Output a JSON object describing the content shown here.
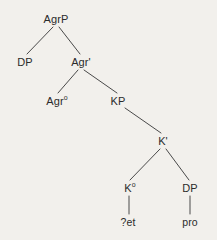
{
  "figure": {
    "kind": "syntax-tree",
    "background_color": "#f2f0ec",
    "line_color": "#4a4a4a",
    "text_color": "#2b2b2b",
    "width": 217,
    "height": 240
  },
  "nodes": {
    "agrp": {
      "label": "AgrP",
      "x": 56,
      "y": 19
    },
    "dp_spec": {
      "label": "DP",
      "x": 25,
      "y": 62
    },
    "agr_bar": {
      "label": "Agr'",
      "x": 81,
      "y": 62
    },
    "agr_head": {
      "label": "Agr",
      "sup": "o",
      "x": 57,
      "y": 101
    },
    "kp": {
      "label": "KP",
      "x": 118,
      "y": 101
    },
    "k_bar": {
      "label": "K'",
      "x": 163,
      "y": 141
    },
    "k_head": {
      "label": "K",
      "sup": "o",
      "x": 130,
      "y": 188
    },
    "dp_comp": {
      "label": "DP",
      "x": 190,
      "y": 188
    },
    "et": {
      "label": "?et",
      "x": 128,
      "y": 222
    },
    "pro": {
      "label": "pro",
      "x": 190,
      "y": 222
    }
  },
  "edges": [
    {
      "from": "agrp",
      "to": "dp_spec",
      "x1": 53,
      "y1": 27,
      "x2": 27,
      "y2": 54
    },
    {
      "from": "agrp",
      "to": "agr_bar",
      "x1": 59,
      "y1": 27,
      "x2": 80,
      "y2": 54
    },
    {
      "from": "agr_bar",
      "to": "agr_head",
      "x1": 78,
      "y1": 70,
      "x2": 58,
      "y2": 93
    },
    {
      "from": "agr_bar",
      "to": "kp",
      "x1": 84,
      "y1": 70,
      "x2": 117,
      "y2": 93
    },
    {
      "from": "kp",
      "to": "k_bar",
      "x1": 125,
      "y1": 108,
      "x2": 161,
      "y2": 133
    },
    {
      "from": "k_bar",
      "to": "k_head",
      "x1": 160,
      "y1": 149,
      "x2": 130,
      "y2": 180
    },
    {
      "from": "k_bar",
      "to": "dp_comp",
      "x1": 166,
      "y1": 149,
      "x2": 189,
      "y2": 180
    },
    {
      "from": "k_head",
      "to": "et",
      "x1": 129,
      "y1": 196,
      "x2": 129,
      "y2": 214
    },
    {
      "from": "dp_comp",
      "to": "pro",
      "x1": 190,
      "y1": 196,
      "x2": 190,
      "y2": 214
    }
  ]
}
